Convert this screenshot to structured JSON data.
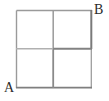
{
  "figure": {
    "kind": "geometry-diagram",
    "background_color": "#ffffff",
    "line_color": "#8d8d8d",
    "line_color_dark": "#7a7a7a",
    "label_color": "#2b2b2b",
    "square": {
      "left": 16,
      "top": 10,
      "right": 92,
      "bottom": 88,
      "width": 76,
      "height": 78
    },
    "midlines": {
      "vertical_x": 53,
      "horizontal_y": 49
    },
    "cells": [
      {
        "name": "top-left-quadrant"
      },
      {
        "name": "top-right-quadrant"
      },
      {
        "name": "bottom-left-quadrant"
      },
      {
        "name": "bottom-right-quadrant"
      }
    ],
    "labels": [
      {
        "id": "A",
        "text": "A",
        "position": "bottom-left-outside"
      },
      {
        "id": "B",
        "text": "B",
        "position": "top-right-outside"
      }
    ]
  }
}
